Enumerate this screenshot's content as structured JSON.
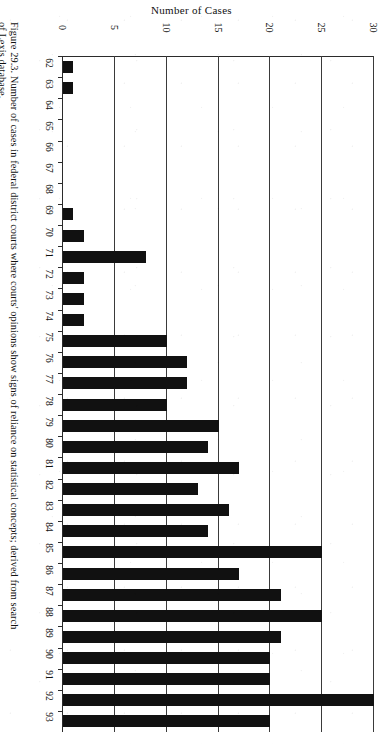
{
  "figure": {
    "caption_line1": "Figure 29.3. Number of cases in federal district courts where courts' opinions show signs of reliance on statistical concepts; derived from search",
    "caption_line2": "of Lexis database."
  },
  "chart_data": {
    "type": "bar",
    "orientation": "horizontal",
    "title": "",
    "xlabel": "Number of Cases",
    "ylabel": "",
    "axis_title": "Number of Cases",
    "categories": [
      "62",
      "63",
      "64",
      "65",
      "66",
      "67",
      "68",
      "69",
      "70",
      "71",
      "72",
      "73",
      "74",
      "75",
      "76",
      "77",
      "78",
      "79",
      "80",
      "81",
      "82",
      "83",
      "84",
      "85",
      "86",
      "87",
      "88",
      "89",
      "90",
      "91",
      "92",
      "93"
    ],
    "values": [
      1,
      1,
      0,
      0,
      0,
      0,
      0,
      1,
      2,
      8,
      2,
      2,
      2,
      10,
      12,
      12,
      10,
      15,
      14,
      17,
      13,
      16,
      14,
      25,
      17,
      21,
      25,
      21,
      20,
      20,
      30,
      20
    ],
    "tick_labels": [
      "0",
      "5",
      "10",
      "15",
      "20",
      "25",
      "30"
    ],
    "tick_values": [
      0,
      5,
      10,
      15,
      20,
      25,
      30
    ],
    "xlim": [
      0,
      30
    ],
    "grid": true,
    "legend": "none",
    "bar_color": "#111111",
    "axis_color": "#2b2b2b",
    "background_color": "#ffffff"
  }
}
